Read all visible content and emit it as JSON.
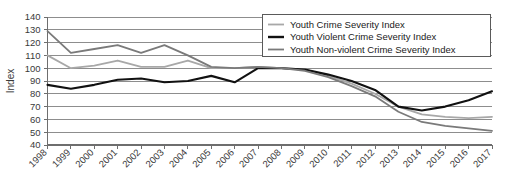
{
  "chart_data": {
    "type": "line",
    "title": "",
    "xlabel": "",
    "ylabel": "Index",
    "ylim": [
      40,
      140
    ],
    "ytick_step": 10,
    "yticks": [
      40,
      50,
      60,
      70,
      80,
      90,
      100,
      110,
      120,
      130,
      140
    ],
    "grid": true,
    "legend_position": "top-right",
    "categories": [
      "1998",
      "1999",
      "2000",
      "2001",
      "2002",
      "2003",
      "2004",
      "2005",
      "2006",
      "2007",
      "2008",
      "2009",
      "2010",
      "2011",
      "2012",
      "2013",
      "2014",
      "2015",
      "2016",
      "2017"
    ],
    "series": [
      {
        "name": "Youth Crime Severity Index",
        "color": "#a8a8a8",
        "width": 1.8,
        "values": [
          110,
          100,
          102,
          106,
          101,
          101,
          106,
          100,
          100,
          101,
          100,
          99,
          94,
          88,
          80,
          70,
          64,
          62,
          61,
          62
        ]
      },
      {
        "name": "Youth Violent Crime Severity Index",
        "color": "#111111",
        "width": 2.1,
        "values": [
          87,
          84,
          87,
          91,
          92,
          89,
          90,
          94,
          89,
          100,
          100,
          99,
          95,
          90,
          83,
          70,
          67,
          70,
          75,
          82
        ]
      },
      {
        "name": "Youth Non-violent Crime Severity Index",
        "color": "#7a7a7a",
        "width": 1.8,
        "values": [
          129,
          112,
          115,
          118,
          112,
          118,
          110,
          101,
          100,
          101,
          100,
          98,
          93,
          86,
          78,
          66,
          58,
          55,
          53,
          51
        ]
      }
    ]
  },
  "axis": {
    "y_title": "Index"
  },
  "legend": {
    "entries": [
      {
        "label": "Youth Crime Severity Index"
      },
      {
        "label": "Youth Violent Crime Severity Index"
      },
      {
        "label": "Youth Non-violent Crime Severity Index"
      }
    ]
  }
}
